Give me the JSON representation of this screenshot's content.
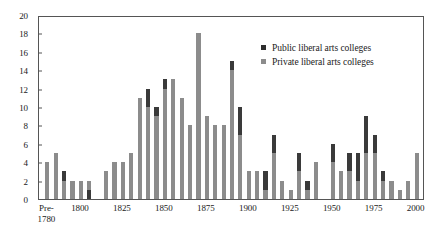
{
  "chart_data": {
    "type": "bar",
    "subtype": "stacked-bar",
    "title": "",
    "subtitle": "",
    "xlabel": "",
    "ylabel": "",
    "ylim": [
      0,
      20
    ],
    "ytick_step": 2,
    "yticks": [
      0,
      2,
      4,
      6,
      8,
      10,
      12,
      14,
      16,
      18,
      20
    ],
    "ytick_labels": [
      "0",
      "2",
      "4",
      "6",
      "8",
      "10",
      "12",
      "14",
      "16",
      "18",
      "20"
    ],
    "xtick_labels": [
      "Pre-\n1780",
      "1800",
      "1825",
      "1850",
      "1875",
      "1900",
      "1925",
      "1950",
      "1975",
      "2000"
    ],
    "xticks": [
      1780,
      1800,
      1825,
      1850,
      1875,
      1900,
      1925,
      1950,
      1975,
      2000
    ],
    "xlim": [
      1775,
      2005
    ],
    "grid": false,
    "legend_position": "top-right",
    "colors": {
      "public": "#3a3a3a",
      "private": "#8c8c8c",
      "axis": "#555555",
      "text": "#1a1a1a",
      "background": "#ffffff"
    },
    "legend": [
      {
        "name": "Public liberal arts colleges",
        "color": "#2e2e2e"
      },
      {
        "name": "Private liberal arts colleges",
        "color": "#8c8c8c"
      }
    ],
    "series": [
      {
        "name": "Public liberal arts colleges",
        "key": "public",
        "color": "#3a3a3a"
      },
      {
        "name": "Private liberal arts colleges",
        "key": "private",
        "color": "#8c8c8c"
      }
    ],
    "categories": [
      1780,
      1785,
      1790,
      1795,
      1800,
      1805,
      1810,
      1815,
      1820,
      1825,
      1830,
      1835,
      1840,
      1845,
      1850,
      1855,
      1860,
      1865,
      1870,
      1875,
      1880,
      1885,
      1890,
      1895,
      1900,
      1905,
      1910,
      1915,
      1920,
      1925,
      1930,
      1935,
      1940,
      1945,
      1950,
      1955,
      1960,
      1965,
      1970,
      1975,
      1980,
      1985,
      1990,
      1995,
      2000
    ],
    "bars": [
      {
        "x": 1780,
        "total": 4,
        "private": 4,
        "public": 0,
        "public_at": "none"
      },
      {
        "x": 1785,
        "total": 5,
        "private": 5,
        "public": 0,
        "public_at": "none"
      },
      {
        "x": 1790,
        "total": 3,
        "private": 2,
        "public": 1,
        "public_at": "top"
      },
      {
        "x": 1795,
        "total": 2,
        "private": 2,
        "public": 0,
        "public_at": "none"
      },
      {
        "x": 1800,
        "total": 2,
        "private": 2,
        "public": 0,
        "public_at": "none"
      },
      {
        "x": 1805,
        "total": 2,
        "private": 1,
        "public": 1,
        "public_at": "bottom"
      },
      {
        "x": 1810,
        "total": 0,
        "private": 0,
        "public": 0,
        "public_at": "none"
      },
      {
        "x": 1815,
        "total": 3,
        "private": 3,
        "public": 0,
        "public_at": "none"
      },
      {
        "x": 1820,
        "total": 4,
        "private": 4,
        "public": 0,
        "public_at": "none"
      },
      {
        "x": 1825,
        "total": 4,
        "private": 4,
        "public": 0,
        "public_at": "none"
      },
      {
        "x": 1830,
        "total": 5,
        "private": 5,
        "public": 0,
        "public_at": "none"
      },
      {
        "x": 1835,
        "total": 11,
        "private": 11,
        "public": 0,
        "public_at": "none"
      },
      {
        "x": 1840,
        "total": 12,
        "private": 10,
        "public": 2,
        "public_at": "top"
      },
      {
        "x": 1845,
        "total": 10,
        "private": 9,
        "public": 1,
        "public_at": "top"
      },
      {
        "x": 1850,
        "total": 13,
        "private": 12,
        "public": 1,
        "public_at": "top"
      },
      {
        "x": 1855,
        "total": 13,
        "private": 13,
        "public": 0,
        "public_at": "none"
      },
      {
        "x": 1860,
        "total": 11,
        "private": 11,
        "public": 0,
        "public_at": "none"
      },
      {
        "x": 1865,
        "total": 8,
        "private": 8,
        "public": 0,
        "public_at": "none"
      },
      {
        "x": 1870,
        "total": 18,
        "private": 18,
        "public": 0,
        "public_at": "none"
      },
      {
        "x": 1875,
        "total": 9,
        "private": 9,
        "public": 0,
        "public_at": "none"
      },
      {
        "x": 1880,
        "total": 8,
        "private": 8,
        "public": 0,
        "public_at": "none"
      },
      {
        "x": 1885,
        "total": 8,
        "private": 8,
        "public": 0,
        "public_at": "none"
      },
      {
        "x": 1890,
        "total": 15,
        "private": 14,
        "public": 1,
        "public_at": "top"
      },
      {
        "x": 1895,
        "total": 10,
        "private": 7,
        "public": 3,
        "public_at": "top"
      },
      {
        "x": 1900,
        "total": 3,
        "private": 3,
        "public": 0,
        "public_at": "none"
      },
      {
        "x": 1905,
        "total": 3,
        "private": 3,
        "public": 0,
        "public_at": "none"
      },
      {
        "x": 1910,
        "total": 3,
        "private": 1,
        "public": 2,
        "public_at": "top"
      },
      {
        "x": 1915,
        "total": 7,
        "private": 5,
        "public": 2,
        "public_at": "top"
      },
      {
        "x": 1920,
        "total": 2,
        "private": 2,
        "public": 0,
        "public_at": "none"
      },
      {
        "x": 1925,
        "total": 1,
        "private": 1,
        "public": 0,
        "public_at": "none"
      },
      {
        "x": 1930,
        "total": 5,
        "private": 3,
        "public": 2,
        "public_at": "top"
      },
      {
        "x": 1935,
        "total": 2,
        "private": 1,
        "public": 1,
        "public_at": "top"
      },
      {
        "x": 1940,
        "total": 4,
        "private": 4,
        "public": 0,
        "public_at": "none"
      },
      {
        "x": 1945,
        "total": 0,
        "private": 0,
        "public": 0,
        "public_at": "none"
      },
      {
        "x": 1950,
        "total": 6,
        "private": 4,
        "public": 2,
        "public_at": "top"
      },
      {
        "x": 1955,
        "total": 3,
        "private": 3,
        "public": 0,
        "public_at": "none"
      },
      {
        "x": 1960,
        "total": 5,
        "private": 3,
        "public": 2,
        "public_at": "top"
      },
      {
        "x": 1965,
        "total": 5,
        "private": 2,
        "public": 3,
        "public_at": "top"
      },
      {
        "x": 1970,
        "total": 9,
        "private": 5,
        "public": 4,
        "public_at": "top"
      },
      {
        "x": 1975,
        "total": 7,
        "private": 5,
        "public": 2,
        "public_at": "top"
      },
      {
        "x": 1980,
        "total": 3,
        "private": 2,
        "public": 1,
        "public_at": "top"
      },
      {
        "x": 1985,
        "total": 2,
        "private": 2,
        "public": 0,
        "public_at": "none"
      },
      {
        "x": 1990,
        "total": 1,
        "private": 1,
        "public": 0,
        "public_at": "none"
      },
      {
        "x": 1995,
        "total": 2,
        "private": 2,
        "public": 0,
        "public_at": "none"
      },
      {
        "x": 2000,
        "total": 5,
        "private": 5,
        "public": 0,
        "public_at": "none"
      }
    ]
  }
}
